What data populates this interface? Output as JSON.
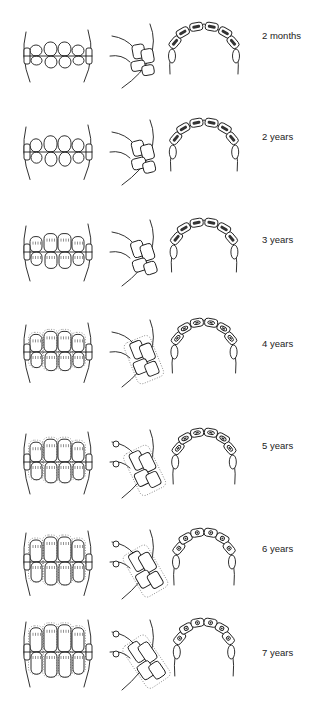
{
  "figure": {
    "views": [
      "front-view",
      "side-view",
      "occlusal-view"
    ],
    "stages": [
      {
        "label": "2 months",
        "top": 4,
        "wear": 0,
        "label_y": 26
      },
      {
        "label": "2 years",
        "top": 100,
        "wear": 1,
        "label_y": 31
      },
      {
        "label": "3 years",
        "top": 200,
        "wear": 2,
        "label_y": 34
      },
      {
        "label": "4 years",
        "top": 300,
        "wear": 3,
        "label_y": 38
      },
      {
        "label": "5 years",
        "top": 410,
        "wear": 4,
        "label_y": 30
      },
      {
        "label": "6 years",
        "top": 510,
        "wear": 5,
        "label_y": 33
      },
      {
        "label": "7 years",
        "top": 600,
        "wear": 6,
        "label_y": 47
      }
    ]
  }
}
